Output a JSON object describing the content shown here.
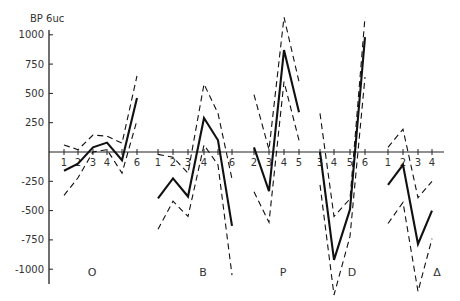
{
  "chart_data": {
    "type": "line",
    "title": "",
    "ylabel": "BP 6uc",
    "xlabel": "",
    "ylim": [
      -1150,
      1050
    ],
    "yticks": [
      1000,
      750,
      500,
      250,
      -250,
      -500,
      -750,
      -1000
    ],
    "grid": false,
    "legend": "none",
    "line_styles": {
      "mean": "solid",
      "upper": "dashed",
      "lower": "dashed"
    },
    "groups": [
      {
        "name": "O",
        "x_labels": [
          "1",
          "2",
          "3",
          "4",
          "5",
          "6"
        ],
        "tick_labels_shown": [
          "1",
          "2",
          "3",
          "4",
          "6"
        ],
        "mean": [
          -160,
          -100,
          40,
          80,
          -70,
          460
        ],
        "upper": [
          60,
          20,
          145,
          135,
          75,
          650
        ],
        "lower": [
          -370,
          -220,
          0,
          20,
          -180,
          270
        ]
      },
      {
        "name": "B",
        "x_labels": [
          "1",
          "2",
          "3",
          "4",
          "5",
          "6"
        ],
        "tick_labels_shown": [
          "1",
          "2",
          "3",
          "4",
          "6"
        ],
        "mean": [
          -395,
          -225,
          -380,
          290,
          100,
          -630
        ],
        "upper": [
          -20,
          -45,
          -180,
          580,
          330,
          -230
        ],
        "lower": [
          -660,
          -420,
          -550,
          60,
          -110,
          -1050
        ]
      },
      {
        "name": "P",
        "x_labels": [
          "2",
          "3",
          "4",
          "5"
        ],
        "tick_labels_shown": [
          "2",
          "3",
          "4",
          "5"
        ],
        "mean": [
          40,
          -335,
          870,
          340
        ],
        "upper": [
          490,
          20,
          1150,
          600
        ],
        "lower": [
          -340,
          -600,
          600,
          100
        ]
      },
      {
        "name": "D",
        "x_labels": [
          "3",
          "4",
          "5",
          "6"
        ],
        "tick_labels_shown": [
          "3",
          "4",
          "5",
          "6"
        ],
        "mean": [
          0,
          -920,
          -490,
          980
        ],
        "upper": [
          330,
          -550,
          -400,
          1150
        ],
        "lower": [
          -280,
          -1220,
          -720,
          640
        ]
      },
      {
        "name": "Δ",
        "x_labels": [
          "1",
          "2",
          "3",
          "4"
        ],
        "tick_labels_shown": [
          "1",
          "2",
          "3",
          "4"
        ],
        "mean": [
          -280,
          -110,
          -785,
          -500
        ],
        "upper": [
          40,
          195,
          -390,
          -250
        ],
        "lower": [
          -610,
          -430,
          -1190,
          -740
        ]
      }
    ]
  },
  "axis": {
    "y_title": "BP 6uc",
    "y_tick_labels": [
      "1000",
      "750",
      "500",
      "250",
      "-250",
      "-500",
      "-750",
      "-1000"
    ]
  }
}
